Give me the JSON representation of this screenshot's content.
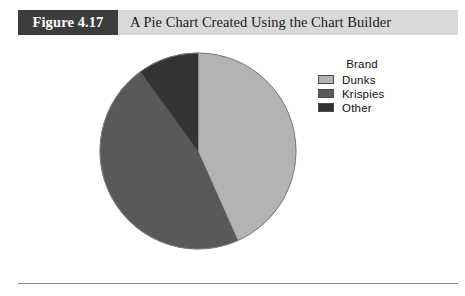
{
  "caption": {
    "figure_number": "Figure 4.17",
    "title": "A Pie Chart Created Using the Chart Builder",
    "bar_background": "#d9d9d9",
    "number_block_background": "#3c3c3c",
    "number_block_text_color": "#ffffff",
    "title_text_color": "#1b1b1b"
  },
  "legend": {
    "title": "Brand",
    "items": [
      {
        "label": "Dunks",
        "color": "#b3b3b3",
        "swatch_name": "legend-swatch-dunks"
      },
      {
        "label": "Krispies",
        "color": "#595959",
        "swatch_name": "legend-swatch-krispies"
      },
      {
        "label": "Other",
        "color": "#333333",
        "swatch_name": "legend-swatch-other"
      }
    ]
  },
  "footer": {
    "rule_color": "#8d8d8d"
  },
  "chart_data": {
    "type": "pie",
    "title": "A Pie Chart Created Using the Chart Builder",
    "legend_title": "Brand",
    "legend_position": "right",
    "categories": [
      "Dunks",
      "Krispies",
      "Other"
    ],
    "values": [
      43.3,
      46.7,
      10.0
    ],
    "units": "percent",
    "colors": [
      "#b3b3b3",
      "#595959",
      "#333333"
    ],
    "start_angle_deg": 0,
    "direction": "clockwise",
    "slice_boundaries_deg": [
      0,
      156,
      324,
      360
    ],
    "center": {
      "x": 198,
      "y": 151
    },
    "radius": 98,
    "outline_color": "#7a7a7a",
    "labels_shown": false,
    "grid": false
  }
}
